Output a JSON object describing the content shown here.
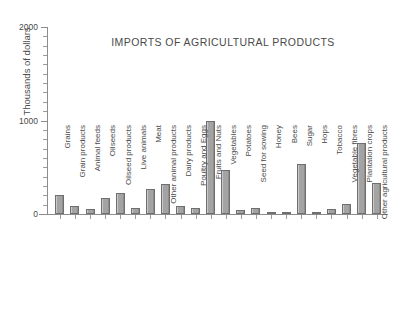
{
  "chart_data": {
    "type": "bar",
    "title": "IMPORTS OF AGRICULTURAL PRODUCTS",
    "xlabel": "",
    "ylabel": "Thousands of dollars",
    "ylim": [
      0,
      2000
    ],
    "ytick_labels": [
      "0",
      "1000",
      "2000"
    ],
    "ytick_values": [
      0,
      1000,
      2000
    ],
    "yminor_step": 100,
    "grid": false,
    "legend": "none",
    "bar_color": "#9d9d9d",
    "bar_edge_color": "#6f6f6f",
    "axis_color": "#8d8d8d",
    "categories": [
      "Grains",
      "Grain products",
      "Animal feeds",
      "Oilseeds",
      "Oilseed products",
      "Live animals",
      "Meat",
      "Other animal products",
      "Dairy products",
      "Poultry and Eggs",
      "Fruits and Nuts",
      "Vegetables",
      "Potatoes",
      "Seed for sowing",
      "Honey",
      "Bees",
      "Sugar",
      "Hops",
      "Tobacco",
      "Vegetable fibres",
      "Plantation crops",
      "Other agricultural products"
    ],
    "values": [
      200,
      90,
      55,
      170,
      230,
      60,
      265,
      320,
      85,
      65,
      1000,
      475,
      40,
      60,
      20,
      20,
      530,
      25,
      55,
      110,
      755,
      330
    ]
  }
}
